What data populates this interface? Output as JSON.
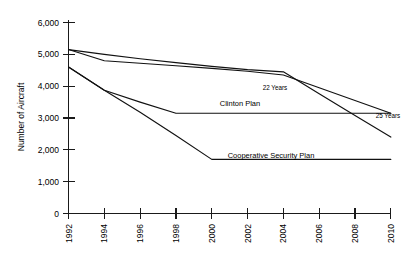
{
  "chart_data": {
    "type": "line",
    "title": "",
    "xlabel": "",
    "ylabel": "Number of Aircraft",
    "xlim": [
      1992,
      2010
    ],
    "ylim": [
      0,
      6000
    ],
    "grid": false,
    "legend_position": "inline-labels",
    "x_tick_labels": [
      "1992",
      "1994",
      "1996",
      "1998",
      "2000",
      "2002",
      "2004",
      "2006",
      "2008",
      "2010"
    ],
    "x_tick_values": [
      1992,
      1994,
      1996,
      1998,
      2000,
      2002,
      2004,
      2006,
      2008,
      2010
    ],
    "y_tick_labels": [
      "0",
      "1,000",
      "2,000",
      "3,000",
      "4,000",
      "5,000",
      "6,000"
    ],
    "y_tick_values": [
      0,
      1000,
      2000,
      3000,
      4000,
      5000,
      6000
    ],
    "x": [
      1992,
      1994,
      1996,
      1998,
      2000,
      2002,
      2004,
      2006,
      2008,
      2010
    ],
    "series": [
      {
        "name": "22 Years",
        "label": "22 Years",
        "points": [
          [
            1992,
            5150
          ],
          [
            1994,
            5000
          ],
          [
            1996,
            4860
          ],
          [
            1998,
            4740
          ],
          [
            2000,
            4620
          ],
          [
            2002,
            4520
          ],
          [
            2004,
            4450
          ],
          [
            2006,
            3760
          ],
          [
            2008,
            3080
          ],
          [
            2010,
            2400
          ]
        ],
        "values": [
          5150,
          5000,
          4860,
          4740,
          4620,
          4520,
          4450,
          3760,
          3080,
          2400
        ]
      },
      {
        "name": "25 Years",
        "label": "25 Years",
        "points": [
          [
            1992,
            5150
          ],
          [
            1994,
            4800
          ],
          [
            1996,
            4720
          ],
          [
            1998,
            4640
          ],
          [
            2000,
            4560
          ],
          [
            2002,
            4470
          ],
          [
            2004,
            4350
          ],
          [
            2006,
            3950
          ],
          [
            2008,
            3550
          ],
          [
            2010,
            3150
          ]
        ],
        "values": [
          5150,
          4800,
          4720,
          4640,
          4560,
          4470,
          4350,
          3950,
          3550,
          3150
        ]
      },
      {
        "name": "Clinton Plan",
        "label": "Clinton Plan",
        "points": [
          [
            1992,
            4600
          ],
          [
            1994,
            3870
          ],
          [
            1996,
            3500
          ],
          [
            1998,
            3150
          ],
          [
            2000,
            3150
          ],
          [
            2002,
            3150
          ],
          [
            2004,
            3150
          ],
          [
            2006,
            3150
          ],
          [
            2008,
            3150
          ],
          [
            2010,
            3150
          ]
        ],
        "values": [
          4600,
          3870,
          3500,
          3150,
          3150,
          3150,
          3150,
          3150,
          3150,
          3150
        ]
      },
      {
        "name": "Cooperative Security Plan",
        "label": "Cooperative Security Plan",
        "points": [
          [
            1992,
            4600
          ],
          [
            1994,
            3870
          ],
          [
            1996,
            3180
          ],
          [
            1998,
            2450
          ],
          [
            2000,
            1700
          ],
          [
            2002,
            1700
          ],
          [
            2004,
            1700
          ],
          [
            2006,
            1700
          ],
          [
            2008,
            1700
          ],
          [
            2010,
            1700
          ]
        ],
        "values": [
          4600,
          3870,
          3180,
          2450,
          1700,
          1700,
          1700,
          1700,
          1700,
          1700
        ]
      }
    ],
    "annotations": [
      {
        "text": "22 Years",
        "x": 2004,
        "y": 4000
      },
      {
        "text": "25 Years",
        "x": 2009,
        "y": 3000
      },
      {
        "text": "Clinton Plan",
        "x": 1999,
        "y": 3300
      },
      {
        "text": "Cooperative Security Plan",
        "x": 2001,
        "y": 1870
      }
    ]
  },
  "axes": {
    "y_title": "Number of Aircraft"
  }
}
